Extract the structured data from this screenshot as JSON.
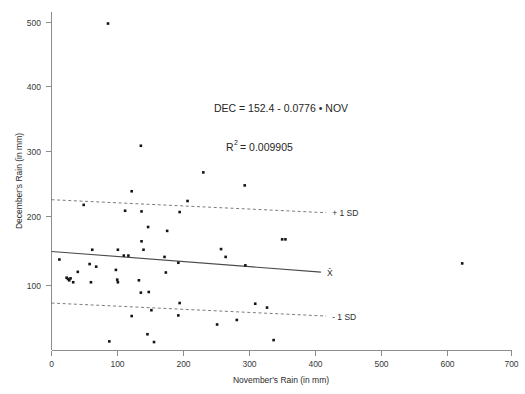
{
  "chart_data": {
    "type": "scatter",
    "title": "",
    "xlabel": "November's Rain (in mm)",
    "ylabel": "December's Rain (in mm)",
    "xlim": [
      0,
      700
    ],
    "ylim": [
      0,
      530
    ],
    "xticks": [
      0,
      100,
      200,
      300,
      400,
      500,
      600,
      700
    ],
    "yticks": [
      100,
      200,
      300,
      400,
      500
    ],
    "grid": false,
    "legend_position": "inline-right",
    "annotations": [
      "DEC = 152.4 - 0.0776 • NOV",
      "R² = 0.009905"
    ],
    "equation": {
      "response": "DEC",
      "predictor": "NOV",
      "intercept": 152.4,
      "slope": -0.0776,
      "text": "DEC = 152.4 - 0.0776 • NOV",
      "r_squared": 0.009905,
      "r_squared_text": "R² = 0.009905",
      "r_squared_base": "R",
      "r_squared_exp": "2",
      "r_squared_value": "= 0.009905"
    },
    "lines": [
      {
        "name": "plus-1-sd",
        "label": "+ 1 SD",
        "style": "dashed",
        "x": [
          0,
          418
        ],
        "y": [
          232,
          212
        ]
      },
      {
        "name": "mean-fit",
        "label": "X̄",
        "style": "solid",
        "x": [
          0,
          410
        ],
        "y": [
          152.4,
          120.6
        ]
      },
      {
        "name": "minus-1-sd",
        "label": "- 1 SD",
        "style": "dashed",
        "x": [
          0,
          418
        ],
        "y": [
          73,
          53
        ]
      }
    ],
    "marker": "square",
    "marker_color": "#141414",
    "points": [
      {
        "x": 86,
        "y": 503
      },
      {
        "x": 136,
        "y": 315
      },
      {
        "x": 231,
        "y": 274
      },
      {
        "x": 294,
        "y": 254
      },
      {
        "x": 122,
        "y": 245
      },
      {
        "x": 207,
        "y": 230
      },
      {
        "x": 49,
        "y": 224
      },
      {
        "x": 112,
        "y": 215
      },
      {
        "x": 137,
        "y": 214
      },
      {
        "x": 195,
        "y": 213
      },
      {
        "x": 147,
        "y": 190
      },
      {
        "x": 176,
        "y": 184
      },
      {
        "x": 351,
        "y": 171
      },
      {
        "x": 356,
        "y": 171
      },
      {
        "x": 137,
        "y": 168
      },
      {
        "x": 62,
        "y": 155
      },
      {
        "x": 101,
        "y": 155
      },
      {
        "x": 140,
        "y": 155
      },
      {
        "x": 258,
        "y": 156
      },
      {
        "x": 110,
        "y": 146
      },
      {
        "x": 117,
        "y": 146
      },
      {
        "x": 172,
        "y": 144
      },
      {
        "x": 265,
        "y": 144
      },
      {
        "x": 12,
        "y": 140
      },
      {
        "x": 625,
        "y": 134
      },
      {
        "x": 193,
        "y": 135
      },
      {
        "x": 295,
        "y": 131
      },
      {
        "x": 58,
        "y": 133
      },
      {
        "x": 68,
        "y": 129
      },
      {
        "x": 98,
        "y": 124
      },
      {
        "x": 174,
        "y": 120
      },
      {
        "x": 40,
        "y": 121
      },
      {
        "x": 23,
        "y": 112
      },
      {
        "x": 25,
        "y": 110
      },
      {
        "x": 27,
        "y": 108
      },
      {
        "x": 29,
        "y": 111
      },
      {
        "x": 33,
        "y": 105
      },
      {
        "x": 60,
        "y": 105
      },
      {
        "x": 100,
        "y": 109
      },
      {
        "x": 101,
        "y": 105
      },
      {
        "x": 133,
        "y": 108
      },
      {
        "x": 136,
        "y": 89
      },
      {
        "x": 148,
        "y": 90
      },
      {
        "x": 195,
        "y": 73
      },
      {
        "x": 310,
        "y": 72
      },
      {
        "x": 328,
        "y": 66
      },
      {
        "x": 152,
        "y": 62
      },
      {
        "x": 193,
        "y": 54
      },
      {
        "x": 122,
        "y": 53
      },
      {
        "x": 282,
        "y": 47
      },
      {
        "x": 252,
        "y": 40
      },
      {
        "x": 146,
        "y": 25
      },
      {
        "x": 88,
        "y": 14
      },
      {
        "x": 156,
        "y": 13
      },
      {
        "x": 338,
        "y": 16
      }
    ]
  },
  "labels": {
    "plus_sd": "+ 1 SD",
    "mean": "X̄",
    "minus_sd": "- 1 SD"
  }
}
